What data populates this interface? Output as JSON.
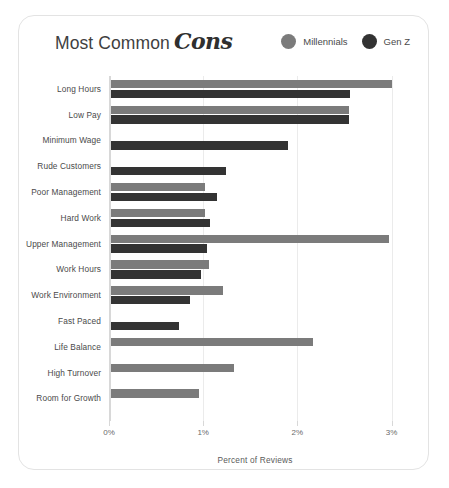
{
  "card": {
    "title_main": "Most Common",
    "title_accent": "Cons"
  },
  "legend": {
    "items": [
      {
        "label": "Millennials",
        "color": "#7b7b7b",
        "key": "millennials"
      },
      {
        "label": "Gen Z",
        "color": "#333333",
        "key": "genz"
      }
    ]
  },
  "axis": {
    "x_title": "Percent of Reviews",
    "x_ticks": [
      "0%",
      "1%",
      "2%",
      "3%"
    ],
    "x_tick_values": [
      0,
      1,
      2,
      3
    ]
  },
  "chart_data": {
    "type": "bar",
    "orientation": "horizontal",
    "xlabel": "Percent of Reviews",
    "ylabel": "",
    "xlim": [
      0,
      3.1
    ],
    "grid": true,
    "legend_position": "top-right",
    "categories": [
      "Long Hours",
      "Low Pay",
      "Minimum Wage",
      "Rude Customers",
      "Poor Management",
      "Hard Work",
      "Upper Management",
      "Work Hours",
      "Work Environment",
      "Fast Paced",
      "Life Balance",
      "High Turnover",
      "Room for Growth"
    ],
    "series": [
      {
        "name": "Millennials",
        "color": "#7b7b7b",
        "values": [
          2.98,
          2.53,
          null,
          null,
          1.0,
          1.0,
          2.95,
          1.04,
          1.19,
          null,
          2.14,
          1.31,
          0.93
        ]
      },
      {
        "name": "Gen Z",
        "color": "#333333",
        "values": [
          2.54,
          2.53,
          1.88,
          1.22,
          1.13,
          1.05,
          1.02,
          0.96,
          0.84,
          0.72,
          null,
          null,
          null
        ]
      }
    ]
  }
}
